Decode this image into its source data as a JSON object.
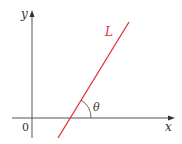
{
  "diagram": {
    "type": "line-inclination",
    "axes": {
      "x_label": "x",
      "y_label": "y",
      "origin_label": "0"
    },
    "line": {
      "label": "L",
      "color": "#e0303a"
    },
    "angle": {
      "label": "θ",
      "description": "angle of inclination between x-axis and line L"
    },
    "colors": {
      "axis": "#444444",
      "text": "#333333",
      "line": "#e0303a",
      "line_label": "#e0303a"
    }
  }
}
